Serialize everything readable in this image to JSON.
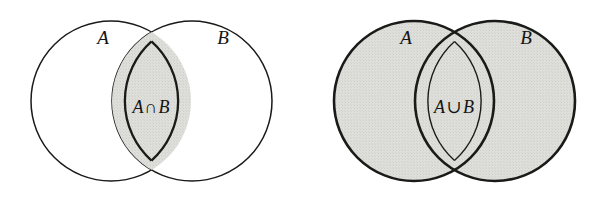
{
  "figure": {
    "name": "venn-diagram-pair",
    "background_color": "#ffffff",
    "width": 605,
    "height": 204
  },
  "style": {
    "fill_shaded": "#dcdcd8",
    "fill_empty": "#ffffff",
    "stroke_color": "#1a1a18",
    "stroke_thin": 1.5,
    "stroke_thick": 2.6
  },
  "panels": [
    {
      "id": "intersection",
      "title": "A intersect B",
      "shaded_region": "lens",
      "circles": [
        {
          "id": "A",
          "label": "A",
          "cx": 111,
          "cy": 101,
          "r": 80
        },
        {
          "id": "B",
          "label": "B",
          "cx": 192,
          "cy": 101,
          "r": 80
        }
      ],
      "set_labels": [
        {
          "text": "A",
          "x": 103,
          "y": 44
        },
        {
          "text": "B",
          "x": 223,
          "y": 44
        }
      ],
      "region_label": {
        "left": "A",
        "operator": "∩",
        "right": "B",
        "full": "A ∩ B",
        "x": 151,
        "y": 113
      }
    },
    {
      "id": "union",
      "title": "A union B",
      "shaded_region": "both-circles",
      "circles": [
        {
          "id": "A",
          "label": "A",
          "cx": 111,
          "cy": 101,
          "r": 80
        },
        {
          "id": "B",
          "label": "B",
          "cx": 192,
          "cy": 101,
          "r": 80
        }
      ],
      "set_labels": [
        {
          "text": "A",
          "x": 103,
          "y": 44
        },
        {
          "text": "B",
          "x": 223,
          "y": 44
        }
      ],
      "region_label": {
        "left": "A",
        "operator": "∪",
        "right": "B",
        "full": "A ∪ B",
        "x": 151,
        "y": 113
      }
    }
  ]
}
